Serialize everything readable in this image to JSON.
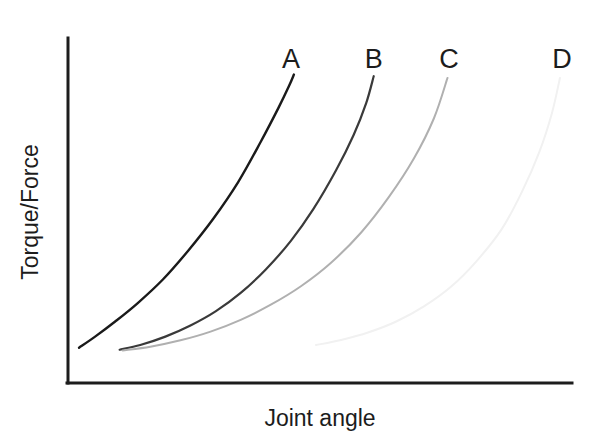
{
  "chart_data": {
    "type": "line",
    "title": "",
    "subtitle": "",
    "xlabel": "Joint angle",
    "ylabel": "Torque/Force",
    "grid": false,
    "legend_position": "inline-end-labels",
    "axis_ticks": "none",
    "xlim": [
      0,
      100
    ],
    "ylim": [
      0,
      100
    ],
    "annotations": [
      {
        "text": "A",
        "x": 44.0,
        "y": 96.0
      },
      {
        "text": "B",
        "x": 60.5,
        "y": 96.0
      },
      {
        "text": "C",
        "x": 75.5,
        "y": 96.0
      },
      {
        "text": "D",
        "x": 98.0,
        "y": 96.0
      }
    ],
    "series": [
      {
        "name": "A",
        "label": "A",
        "color": "#1a1a1a",
        "line_width": 2.4,
        "x": [
          1.8,
          5.0,
          9.0,
          13.5,
          18.5,
          23.5,
          28.5,
          33.5,
          38.0,
          41.5,
          43.6,
          44.6
        ],
        "y": [
          10.2,
          13.5,
          18.0,
          23.5,
          30.5,
          39.0,
          48.5,
          59.5,
          71.5,
          81.5,
          88.0,
          91.5
        ]
      },
      {
        "name": "B",
        "label": "B",
        "color": "#3a3a3a",
        "line_width": 2.2,
        "x": [
          9.9,
          14.0,
          19.0,
          24.0,
          29.0,
          34.0,
          39.0,
          44.0,
          48.5,
          53.0,
          56.5,
          59.0,
          60.5
        ],
        "y": [
          9.6,
          11.0,
          13.5,
          16.8,
          21.0,
          26.5,
          33.5,
          42.0,
          51.5,
          63.0,
          73.5,
          83.0,
          91.0
        ]
      },
      {
        "name": "C",
        "label": "C",
        "color": "#b0b0b0",
        "line_width": 2.0,
        "x": [
          10.5,
          16.0,
          22.0,
          28.0,
          34.0,
          40.0,
          46.0,
          52.0,
          58.0,
          63.5,
          68.5,
          72.5,
          75.2
        ],
        "y": [
          9.4,
          10.5,
          12.4,
          15.0,
          18.5,
          23.0,
          28.5,
          35.5,
          44.5,
          55.0,
          66.5,
          78.5,
          90.5
        ]
      },
      {
        "name": "D",
        "label": "D",
        "color": "#f1f1f1",
        "line_width": 2.0,
        "x": [
          49.0,
          54.0,
          59.5,
          65.0,
          70.5,
          76.0,
          81.0,
          86.0,
          90.0,
          93.5,
          96.0,
          97.6
        ],
        "y": [
          11.0,
          12.5,
          14.8,
          18.0,
          22.5,
          28.5,
          36.0,
          45.5,
          56.5,
          68.5,
          80.0,
          90.5
        ]
      }
    ]
  },
  "axes": {
    "axis_color": "#1c1c1c",
    "axis_line_width": 3,
    "x_axis_label": "Joint angle",
    "y_axis_label": "Torque/Force"
  }
}
